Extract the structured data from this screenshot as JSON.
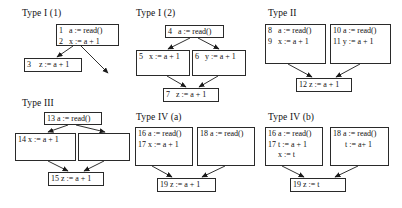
{
  "figure": {
    "background": "#ffffff",
    "ink": "#111111",
    "box_border": "#2a2a2a",
    "width": 402,
    "height": 208
  },
  "groups": [
    {
      "id": "type-i-1",
      "title": "Type I (1)",
      "title_pos": {
        "x": 22,
        "y": 8
      },
      "nodes": [
        {
          "id": "n1",
          "x": 56,
          "y": 24,
          "w": 63,
          "h": 22,
          "lines": [
            "1   a := read()",
            "2   x := a + 1"
          ]
        },
        {
          "id": "n3",
          "x": 24,
          "y": 58,
          "w": 58,
          "h": 14,
          "lines": [
            "3    z := a + 1"
          ]
        }
      ],
      "edges": [
        {
          "from": "n1-bottom-left",
          "x1": 73,
          "y1": 46,
          "x2": 57,
          "y2": 57
        },
        {
          "from": "n1-bottom-right",
          "x1": 81,
          "y1": 46,
          "x2": 108,
          "y2": 73
        }
      ]
    },
    {
      "id": "type-i-2",
      "title": "Type I (2)",
      "title_pos": {
        "x": 136,
        "y": 8
      },
      "nodes": [
        {
          "id": "n4",
          "x": 165,
          "y": 25,
          "w": 59,
          "h": 13,
          "lines": [
            "4   a := read()"
          ]
        },
        {
          "id": "n5",
          "x": 136,
          "y": 50,
          "w": 54,
          "h": 26,
          "lines": [
            "5   x := a + 1"
          ]
        },
        {
          "id": "n6",
          "x": 192,
          "y": 50,
          "w": 54,
          "h": 26,
          "lines": [
            "6   y := a + 1"
          ]
        },
        {
          "id": "n7",
          "x": 163,
          "y": 88,
          "w": 56,
          "h": 14,
          "lines": [
            "7   z := a + 1"
          ]
        }
      ],
      "edges": [
        {
          "x1": 190,
          "y1": 38,
          "x2": 168,
          "y2": 49
        },
        {
          "x1": 198,
          "y1": 38,
          "x2": 219,
          "y2": 49
        },
        {
          "x1": 167,
          "y1": 76,
          "x2": 186,
          "y2": 87
        },
        {
          "x1": 218,
          "y1": 76,
          "x2": 199,
          "y2": 87
        }
      ]
    },
    {
      "id": "type-ii",
      "title": "Type II",
      "title_pos": {
        "x": 268,
        "y": 8
      },
      "nodes": [
        {
          "id": "n8",
          "x": 265,
          "y": 24,
          "w": 61,
          "h": 40,
          "lines": [
            "8   a := read()",
            "9   x := a + 1"
          ]
        },
        {
          "id": "n10",
          "x": 330,
          "y": 24,
          "w": 61,
          "h": 40,
          "lines": [
            "10 a := read()",
            "11 y := a + 1"
          ]
        },
        {
          "id": "n12",
          "x": 296,
          "y": 78,
          "w": 56,
          "h": 14,
          "lines": [
            "12 z := a + 1"
          ]
        }
      ],
      "edges": [
        {
          "x1": 288,
          "y1": 64,
          "x2": 312,
          "y2": 77
        },
        {
          "x1": 360,
          "y1": 64,
          "x2": 336,
          "y2": 77
        }
      ]
    },
    {
      "id": "type-iii",
      "title": "Type III",
      "title_pos": {
        "x": 22,
        "y": 98
      },
      "nodes": [
        {
          "id": "n13",
          "x": 44,
          "y": 112,
          "w": 58,
          "h": 13,
          "lines": [
            "13 a := read()"
          ]
        },
        {
          "id": "n14",
          "x": 15,
          "y": 133,
          "w": 61,
          "h": 28,
          "lines": [
            "14 x := a + 1"
          ]
        },
        {
          "id": "n-empty",
          "x": 78,
          "y": 133,
          "w": 52,
          "h": 28,
          "lines": [
            ""
          ]
        },
        {
          "id": "n15",
          "x": 48,
          "y": 172,
          "w": 56,
          "h": 14,
          "lines": [
            "15 z := a + 1"
          ]
        }
      ],
      "edges": [
        {
          "x1": 68,
          "y1": 125,
          "x2": 48,
          "y2": 132
        },
        {
          "x1": 76,
          "y1": 125,
          "x2": 105,
          "y2": 132
        },
        {
          "x1": 48,
          "y1": 161,
          "x2": 68,
          "y2": 171
        },
        {
          "x1": 104,
          "y1": 161,
          "x2": 84,
          "y2": 171
        }
      ]
    },
    {
      "id": "type-iv-a",
      "title": "Type IV (a)",
      "title_pos": {
        "x": 136,
        "y": 112
      },
      "nodes": [
        {
          "id": "n16a",
          "x": 135,
          "y": 127,
          "w": 58,
          "h": 39,
          "lines": [
            "16 a := read()",
            "17 x := a + 1"
          ]
        },
        {
          "id": "n18a",
          "x": 197,
          "y": 127,
          "w": 58,
          "h": 39,
          "lines": [
            "18 a := read()"
          ]
        },
        {
          "id": "n19a",
          "x": 157,
          "y": 178,
          "w": 59,
          "h": 14,
          "lines": [
            "19 z := a + 1"
          ]
        }
      ],
      "edges": [
        {
          "x1": 152,
          "y1": 166,
          "x2": 172,
          "y2": 177
        },
        {
          "x1": 225,
          "y1": 166,
          "x2": 202,
          "y2": 177
        }
      ]
    },
    {
      "id": "type-iv-b",
      "title": "Type IV (b)",
      "title_pos": {
        "x": 268,
        "y": 112
      },
      "nodes": [
        {
          "id": "n16b",
          "x": 265,
          "y": 127,
          "w": 58,
          "h": 39,
          "lines": [
            "16 a := read()",
            "17 t := a + 1",
            "     x := t"
          ]
        },
        {
          "id": "n18b",
          "x": 330,
          "y": 127,
          "w": 59,
          "h": 39,
          "lines": [
            "18 a := read()",
            "      t := a+ 1"
          ]
        },
        {
          "id": "n19b",
          "x": 290,
          "y": 178,
          "w": 56,
          "h": 14,
          "lines": [
            "19 z := t"
          ]
        }
      ],
      "edges": [
        {
          "x1": 282,
          "y1": 166,
          "x2": 304,
          "y2": 177
        },
        {
          "x1": 358,
          "y1": 166,
          "x2": 335,
          "y2": 177
        }
      ]
    }
  ]
}
